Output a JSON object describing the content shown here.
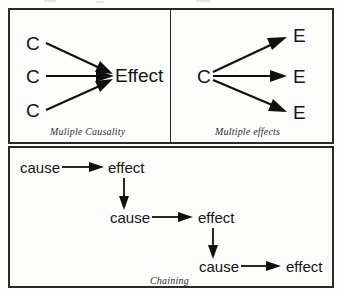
{
  "figure": {
    "background_color": "#fdfdfb",
    "line_color": "#101010",
    "border_color": "#2b2b2b"
  },
  "panels": [
    {
      "id": "multiple-causality",
      "caption": "Muliple Causality",
      "causes": [
        "C",
        "C",
        "C"
      ],
      "effects": [
        "Effect"
      ],
      "arrow_count": 3
    },
    {
      "id": "multiple-effects",
      "caption": "Multiple effects",
      "causes": [
        "C"
      ],
      "effects": [
        "E",
        "E",
        "E"
      ],
      "arrow_count": 3
    },
    {
      "id": "chaining",
      "caption": "Chaining",
      "steps": [
        {
          "cause": "cause",
          "effect": "effect"
        },
        {
          "cause": "cause",
          "effect": "effect"
        },
        {
          "cause": "cause",
          "effect": "effect"
        }
      ],
      "arrow_count": 5
    }
  ],
  "labels": {
    "mc_cause_1": "C",
    "mc_cause_2": "C",
    "mc_cause_3": "C",
    "mc_effect": "Effect",
    "mc_caption": "Muliple Causality",
    "me_cause": "C",
    "me_effect_1": "E",
    "me_effect_2": "E",
    "me_effect_3": "E",
    "me_caption": "Multiple effects",
    "ch_cause_1": "cause",
    "ch_effect_1": "effect",
    "ch_cause_2": "cause",
    "ch_effect_2": "effect",
    "ch_cause_3": "cause",
    "ch_effect_3": "effect",
    "ch_caption": "Chaining"
  }
}
